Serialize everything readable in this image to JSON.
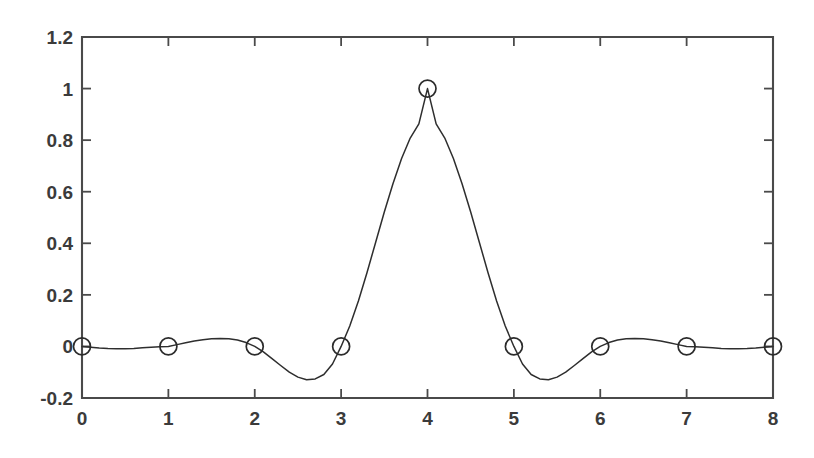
{
  "figure": {
    "background_color": "#ffffff",
    "axis_color": "#4a4a4a",
    "curve_color": "#2e2e2e",
    "marker_color": "#2b2b2b",
    "tick_label_color": "#3b3b3b"
  },
  "chart_data": {
    "type": "line",
    "title": "",
    "subtitle": "",
    "xlabel": "",
    "ylabel": "",
    "xlim": [
      0,
      8
    ],
    "ylim": [
      -0.2,
      1.2
    ],
    "grid": false,
    "legend": null,
    "legend_position": "none",
    "xticks": [
      0,
      1,
      2,
      3,
      4,
      5,
      6,
      7,
      8
    ],
    "xtick_labels": [
      "0",
      "1",
      "2",
      "3",
      "4",
      "5",
      "6",
      "7",
      "8"
    ],
    "yticks": [
      -0.2,
      0,
      0.2,
      0.4,
      0.6,
      0.8,
      1,
      1.2
    ],
    "ytick_labels": [
      "-0.2",
      "0",
      "0.2",
      "0.4",
      "0.6",
      "0.8",
      "1",
      "1.2"
    ],
    "annotations": [],
    "series": [
      {
        "name": "sinc interpolation kernel",
        "marker": "circle-open",
        "line_style": "solid",
        "sample_points": {
          "x": [
            0,
            1,
            2,
            3,
            4,
            5,
            6,
            7,
            8
          ],
          "y": [
            0,
            0,
            0,
            0,
            1,
            0,
            0,
            0,
            0
          ]
        },
        "x": [
          0,
          0.1,
          0.2,
          0.3,
          0.4,
          0.5,
          0.6,
          0.7,
          0.8,
          0.9,
          1,
          1.1,
          1.2,
          1.3,
          1.4,
          1.5,
          1.6,
          1.7,
          1.8,
          1.9,
          2,
          2.1,
          2.2,
          2.3,
          2.4,
          2.5,
          2.6,
          2.7,
          2.8,
          2.9,
          3,
          3.1,
          3.2,
          3.3,
          3.4,
          3.5,
          3.6,
          3.7,
          3.8,
          3.9,
          4,
          4.1,
          4.2,
          4.3,
          4.4,
          4.5,
          4.6,
          4.7,
          4.8,
          4.9,
          5,
          5.1,
          5.2,
          5.3,
          5.4,
          5.5,
          5.6,
          5.7,
          5.8,
          5.9,
          6,
          6.1,
          6.2,
          6.3,
          6.4,
          6.5,
          6.6,
          6.7,
          6.8,
          6.9,
          7,
          7.1,
          7.2,
          7.3,
          7.4,
          7.5,
          7.6,
          7.7,
          7.8,
          7.9,
          8
        ],
        "y": [
          0,
          -0.003,
          -0.006,
          -0.008,
          -0.009,
          -0.009,
          -0.008,
          -0.005,
          -0.003,
          -0.001,
          0,
          0.007,
          0.014,
          0.021,
          0.026,
          0.03,
          0.031,
          0.03,
          0.025,
          0.015,
          0,
          -0.021,
          -0.047,
          -0.074,
          -0.1,
          -0.119,
          -0.129,
          -0.126,
          -0.109,
          -0.068,
          0,
          0.079,
          0.176,
          0.287,
          0.404,
          0.521,
          0.631,
          0.729,
          0.808,
          0.863,
          1,
          0.863,
          0.808,
          0.729,
          0.631,
          0.521,
          0.404,
          0.287,
          0.176,
          0.079,
          0,
          -0.068,
          -0.109,
          -0.126,
          -0.129,
          -0.119,
          -0.1,
          -0.074,
          -0.047,
          -0.021,
          0,
          0.015,
          0.025,
          0.03,
          0.031,
          0.03,
          0.026,
          0.021,
          0.014,
          0.007,
          0,
          -0.001,
          -0.003,
          -0.005,
          -0.008,
          -0.009,
          -0.009,
          -0.008,
          -0.006,
          -0.003,
          0
        ]
      }
    ]
  }
}
